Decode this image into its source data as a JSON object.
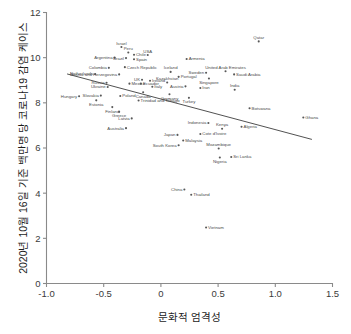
{
  "chart_data": {
    "type": "scatter",
    "title": "",
    "xlabel": "문화적 엄격성",
    "ylabel": "2020년 10월 16일 기준 백만명 당 코로나19 감염 케이스",
    "xlim": [
      -1.0,
      1.5
    ],
    "ylim": [
      0,
      12
    ],
    "xticks": [
      "-1.0",
      "-0.5",
      "0",
      "0.5",
      "1.0",
      "1.5"
    ],
    "xtick_values": [
      -1.0,
      -0.5,
      0,
      0.5,
      1.0,
      1.5
    ],
    "yticks": [
      "0",
      "2",
      "4",
      "6",
      "8",
      "10",
      "12"
    ],
    "ytick_values": [
      0,
      2,
      4,
      6,
      8,
      10,
      12
    ],
    "grid": false,
    "legend": "none",
    "marker_color": "#585858",
    "fit_line_color": "#3d3d3d",
    "fit_line": {
      "label": "linear trend",
      "x_start": -0.82,
      "y_start": 9.28,
      "x_end": 1.32,
      "y_end": 6.38
    },
    "points": [
      {
        "label": "Qatar",
        "x": 0.855,
        "y": 10.72,
        "label_pos": "above"
      },
      {
        "label": "Israel",
        "x": -0.345,
        "y": 10.47,
        "label_pos": "above"
      },
      {
        "label": "Peru",
        "x": -0.285,
        "y": 10.23,
        "label_pos": "above"
      },
      {
        "label": "Chile",
        "x": -0.235,
        "y": 10.13,
        "label_pos": "right"
      },
      {
        "label": "USA",
        "x": -0.115,
        "y": 10.12,
        "label_pos": "above"
      },
      {
        "label": "Argentina",
        "x": -0.405,
        "y": 10.0,
        "label_pos": "left"
      },
      {
        "label": "Brazil",
        "x": -0.305,
        "y": 9.98,
        "label_pos": "left"
      },
      {
        "label": "Spain",
        "x": -0.235,
        "y": 9.93,
        "label_pos": "right"
      },
      {
        "label": "Armenia",
        "x": 0.225,
        "y": 9.94,
        "label_pos": "right"
      },
      {
        "label": "Czech Republic",
        "x": -0.315,
        "y": 9.58,
        "label_pos": "right"
      },
      {
        "label": "Colombia",
        "x": -0.455,
        "y": 9.55,
        "label_pos": "left"
      },
      {
        "label": "Iceland",
        "x": 0.085,
        "y": 9.37,
        "label_pos": "above"
      },
      {
        "label": "United Arab Emirates",
        "x": 0.565,
        "y": 9.4,
        "label_pos": "above"
      },
      {
        "label": "Sweden",
        "x": 0.395,
        "y": 9.33,
        "label_pos": "left"
      },
      {
        "label": "Saudi Arabia",
        "x": 0.64,
        "y": 9.26,
        "label_pos": "right"
      },
      {
        "label": "Netherlands",
        "x": -0.575,
        "y": 9.28,
        "label_pos": "left"
      },
      {
        "label": "Bosnia and Herzegovina",
        "x": -0.365,
        "y": 9.26,
        "label_pos": "left"
      },
      {
        "label": "Portugal",
        "x": 0.155,
        "y": 9.15,
        "label_pos": "right"
      },
      {
        "label": "Singapore",
        "x": 0.42,
        "y": 9.08,
        "label_pos": "below"
      },
      {
        "label": "UK",
        "x": -0.165,
        "y": 9.02,
        "label_pos": "left"
      },
      {
        "label": "Ireland",
        "x": -0.095,
        "y": 8.98,
        "label_pos": "right"
      },
      {
        "label": "Russia",
        "x": -0.475,
        "y": 8.89,
        "label_pos": "left"
      },
      {
        "label": "Mexico",
        "x": -0.275,
        "y": 8.85,
        "label_pos": "right"
      },
      {
        "label": "Ecuador",
        "x": -0.175,
        "y": 8.85,
        "label_pos": "right"
      },
      {
        "label": "Kazakhstan",
        "x": 0.055,
        "y": 8.9,
        "label_pos": "above"
      },
      {
        "label": "Austria",
        "x": 0.215,
        "y": 8.73,
        "label_pos": "left"
      },
      {
        "label": "Ukraine",
        "x": -0.465,
        "y": 8.7,
        "label_pos": "left"
      },
      {
        "label": "Italy",
        "x": -0.075,
        "y": 8.71,
        "label_pos": "right"
      },
      {
        "label": "Iran",
        "x": 0.345,
        "y": 8.66,
        "label_pos": "right"
      },
      {
        "label": "India",
        "x": 0.645,
        "y": 8.58,
        "label_pos": "above"
      },
      {
        "label": "Canada",
        "x": -0.155,
        "y": 8.47,
        "label_pos": "below"
      },
      {
        "label": "Germany",
        "x": 0.075,
        "y": 8.38,
        "label_pos": "below"
      },
      {
        "label": "Hungary",
        "x": -0.715,
        "y": 8.29,
        "label_pos": "left"
      },
      {
        "label": "Slovakia",
        "x": -0.525,
        "y": 8.32,
        "label_pos": "left"
      },
      {
        "label": "Poland",
        "x": -0.355,
        "y": 8.3,
        "label_pos": "right"
      },
      {
        "label": "Turkey",
        "x": 0.245,
        "y": 8.22,
        "label_pos": "below"
      },
      {
        "label": "Estonia",
        "x": -0.565,
        "y": 8.11,
        "label_pos": "below"
      },
      {
        "label": "Trinidad and Tobago",
        "x": -0.195,
        "y": 8.1,
        "label_pos": "right"
      },
      {
        "label": "Botswana",
        "x": 0.775,
        "y": 7.76,
        "label_pos": "right"
      },
      {
        "label": "Finland",
        "x": -0.425,
        "y": 7.81,
        "label_pos": "below"
      },
      {
        "label": "Greece",
        "x": -0.365,
        "y": 7.6,
        "label_pos": "below"
      },
      {
        "label": "Ghana",
        "x": 1.245,
        "y": 7.35,
        "label_pos": "right"
      },
      {
        "label": "Latvia",
        "x": -0.255,
        "y": 7.31,
        "label_pos": "left"
      },
      {
        "label": "Indonesia",
        "x": 0.415,
        "y": 7.11,
        "label_pos": "left"
      },
      {
        "label": "Algeria",
        "x": 0.705,
        "y": 6.94,
        "label_pos": "right"
      },
      {
        "label": "Australia",
        "x": -0.305,
        "y": 6.88,
        "label_pos": "left"
      },
      {
        "label": "Kenya",
        "x": 0.535,
        "y": 6.85,
        "label_pos": "above"
      },
      {
        "label": "Japan",
        "x": 0.145,
        "y": 6.58,
        "label_pos": "left"
      },
      {
        "label": "Cote d'Ivoire",
        "x": 0.345,
        "y": 6.62,
        "label_pos": "right"
      },
      {
        "label": "Malaysia",
        "x": 0.195,
        "y": 6.33,
        "label_pos": "right"
      },
      {
        "label": "South Korea",
        "x": 0.155,
        "y": 6.12,
        "label_pos": "left"
      },
      {
        "label": "Mozambique",
        "x": 0.505,
        "y": 5.98,
        "label_pos": "above"
      },
      {
        "label": "Sri Lanka",
        "x": 0.615,
        "y": 5.6,
        "label_pos": "right"
      },
      {
        "label": "Nigeria",
        "x": 0.515,
        "y": 5.58,
        "label_pos": "below"
      },
      {
        "label": "China",
        "x": 0.205,
        "y": 4.16,
        "label_pos": "left"
      },
      {
        "label": "Thailand",
        "x": 0.265,
        "y": 3.93,
        "label_pos": "right"
      },
      {
        "label": "Vietnam",
        "x": 0.395,
        "y": 2.48,
        "label_pos": "right"
      }
    ]
  }
}
